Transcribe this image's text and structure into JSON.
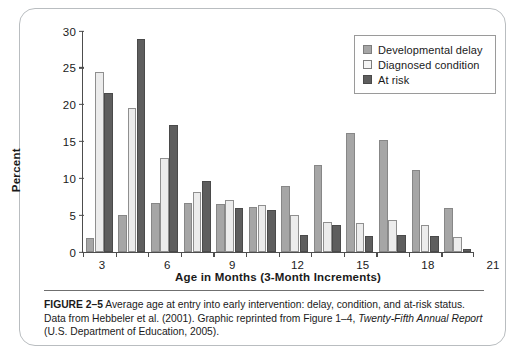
{
  "figure": {
    "label": "FIGURE 2–5",
    "caption_text": " Average age at entry into early intervention: delay, condition, and at-risk status. Data from Hebbeler et al. (2001). Graphic reprinted from Figure 1–4, ",
    "caption_italic": "Twenty-Fifth Annual Report",
    "caption_tail": " (U.S. Department of Education, 2005)."
  },
  "legend": {
    "position": "top-right",
    "items": [
      {
        "label": "Developmental delay",
        "color": "#a6a6a6"
      },
      {
        "label": "Diagnosed condition",
        "color": "#ececec"
      },
      {
        "label": "At risk",
        "color": "#5e5e5e"
      }
    ]
  },
  "chart_data": {
    "type": "bar",
    "title": "",
    "xlabel": "Age in Months (3-Month Increments)",
    "ylabel": "Percent",
    "categories": [
      "3",
      "6",
      "9",
      "12",
      "15",
      "18",
      "21",
      "24",
      "27",
      "30",
      "33",
      "36"
    ],
    "ylim": [
      0,
      30
    ],
    "yticks": [
      0,
      5,
      10,
      15,
      20,
      25,
      30
    ],
    "ytick_labels": [
      "0",
      "5",
      "10",
      "15",
      "20",
      "25",
      "30"
    ],
    "grid": false,
    "series": [
      {
        "name": "Developmental delay",
        "color": "#a6a6a6",
        "values": [
          1.9,
          5.0,
          6.7,
          6.7,
          6.5,
          6.1,
          8.9,
          11.8,
          16.2,
          15.2,
          11.1,
          6.0
        ]
      },
      {
        "name": "Diagnosed condition",
        "color": "#ececec",
        "values": [
          24.5,
          19.6,
          12.8,
          8.2,
          7.0,
          6.4,
          5.0,
          4.1,
          4.0,
          4.4,
          3.7,
          2.0
        ]
      },
      {
        "name": "At risk",
        "color": "#5e5e5e",
        "values": [
          21.6,
          28.9,
          17.2,
          9.6,
          6.0,
          5.7,
          2.3,
          3.6,
          2.2,
          2.3,
          2.2,
          0.4
        ]
      }
    ]
  }
}
